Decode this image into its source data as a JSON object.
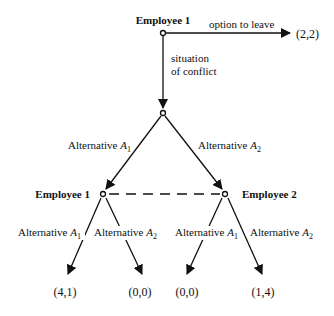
{
  "diagram": {
    "type": "game-tree",
    "root": {
      "player": "Employee 1",
      "leave_edge": {
        "label": "option to leave",
        "payoff": "(2,2)"
      },
      "conflict_edge": {
        "label_line1": "situation",
        "label_line2": "of conflict"
      }
    },
    "chance_node": {
      "left_edge": {
        "label": "Alternative ",
        "sub": "1",
        "var": "A"
      },
      "right_edge": {
        "label": "Alternative ",
        "sub": "2",
        "var": "A"
      }
    },
    "info_set": {
      "left_player": "Employee 1",
      "right_player": "Employee 2",
      "left_node_edges": [
        {
          "label": "Alternative ",
          "var": "A",
          "sub": "1",
          "payoff": "(4,1)"
        },
        {
          "label": "Alternative ",
          "var": "A",
          "sub": "2",
          "payoff": "(0,0)"
        }
      ],
      "right_node_edges": [
        {
          "label": "Alternative ",
          "var": "A",
          "sub": "1",
          "payoff": "(0,0)"
        },
        {
          "label": "Alternative ",
          "var": "A",
          "sub": "2",
          "payoff": "(1,4)"
        }
      ]
    }
  }
}
